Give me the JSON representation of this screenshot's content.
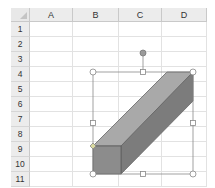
{
  "spreadsheet": {
    "columns": [
      {
        "label": "A",
        "x": 30,
        "w": 43
      },
      {
        "label": "B",
        "x": 73,
        "w": 46
      },
      {
        "label": "C",
        "x": 119,
        "w": 43
      },
      {
        "label": "D",
        "x": 162,
        "w": 45
      }
    ],
    "rows": [
      "1",
      "2",
      "3",
      "4",
      "5",
      "6",
      "7",
      "8",
      "9",
      "10",
      "11"
    ]
  },
  "shape": {
    "type": "cube",
    "colors": {
      "top": "#a9a9a9",
      "front": "#8c8c8c",
      "side": "#7c7c7c",
      "edge": "#5a5a5a"
    },
    "selected": true
  }
}
